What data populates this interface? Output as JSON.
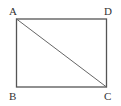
{
  "diagram": {
    "type": "rectangle-with-diagonal",
    "vertices": [
      {
        "label": "A",
        "position": "top-left"
      },
      {
        "label": "D",
        "position": "top-right"
      },
      {
        "label": "B",
        "position": "bottom-left"
      },
      {
        "label": "C",
        "position": "bottom-right"
      }
    ],
    "segments": [
      "AB",
      "BC",
      "CD",
      "DA",
      "AC"
    ],
    "stroke_color": "#555555"
  }
}
